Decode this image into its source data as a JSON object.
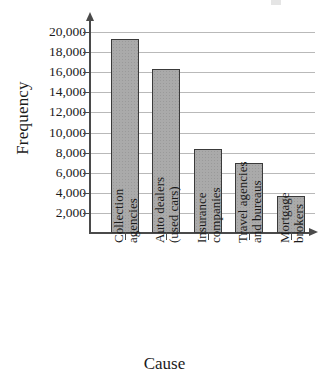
{
  "chart_data": {
    "type": "bar",
    "title": "",
    "xlabel": "Cause",
    "ylabel": "Frequency",
    "categories": [
      "Collection agencies",
      "Auto dealers (used cars)",
      "Insurance companies",
      "Travel agencies and bureaus",
      "Mortgage brokers"
    ],
    "category_lines": [
      [
        "Collection",
        "agencies"
      ],
      [
        "Auto dealers",
        "(used cars)"
      ],
      [
        "Insurance",
        "companies"
      ],
      [
        "Travel agencies",
        "and bureaus"
      ],
      [
        "Mortgage",
        "brokers"
      ]
    ],
    "values": [
      19300,
      16300,
      8400,
      7000,
      3700
    ],
    "ylim": [
      0,
      20000
    ],
    "ytick_values": [
      2000,
      4000,
      6000,
      8000,
      10000,
      12000,
      14000,
      16000,
      18000,
      20000
    ],
    "ytick_labels": [
      "2,000",
      "4,000",
      "6,000",
      "8,000",
      "10,000",
      "12,000",
      "14,000",
      "16,000",
      "18,000",
      "20,000"
    ],
    "grid": true,
    "legend": "none",
    "bar_fill_color": "#aaaaaa",
    "bar_edge_color": "#3a3a3a",
    "grid_color": "#b9b9b9",
    "axis_color": "#4a4a4a"
  }
}
